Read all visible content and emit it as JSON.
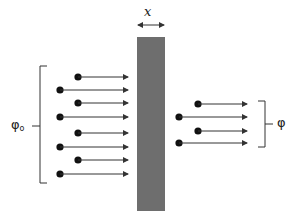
{
  "diagram": {
    "thickness_label": "x",
    "incident_flux_label": "φ",
    "incident_flux_subscript": "o",
    "transmitted_flux_label": "φ",
    "slab_color": "#6e6e6e",
    "line_color": "#333333",
    "incident_particles": 8,
    "transmitted_particles": 4
  }
}
